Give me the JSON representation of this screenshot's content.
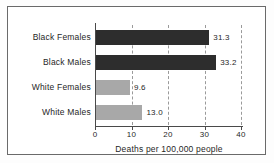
{
  "chart_data": {
    "type": "bar",
    "orientation": "horizontal",
    "title": "",
    "xlabel": "Deaths per 100,000 people",
    "ylabel": "",
    "categories": [
      "Black Females",
      "Black Males",
      "White Females",
      "White Males"
    ],
    "values": [
      31.3,
      33.2,
      9.6,
      13.0
    ],
    "value_labels": [
      "31.3",
      "33.2",
      "9.6",
      "13.0"
    ],
    "bar_colors": [
      "#2d2d2d",
      "#2d2d2d",
      "#a8a8a8",
      "#a8a8a8"
    ],
    "xlim": [
      0,
      40
    ],
    "xticks": [
      0,
      10,
      20,
      30,
      40
    ],
    "xticklabels": [
      "0",
      "10",
      "20",
      "30",
      "40"
    ],
    "grid": "vertical-dashed",
    "legend": null
  },
  "figure": {
    "border_color": "#6a6a6a",
    "background": "#ffffff"
  }
}
